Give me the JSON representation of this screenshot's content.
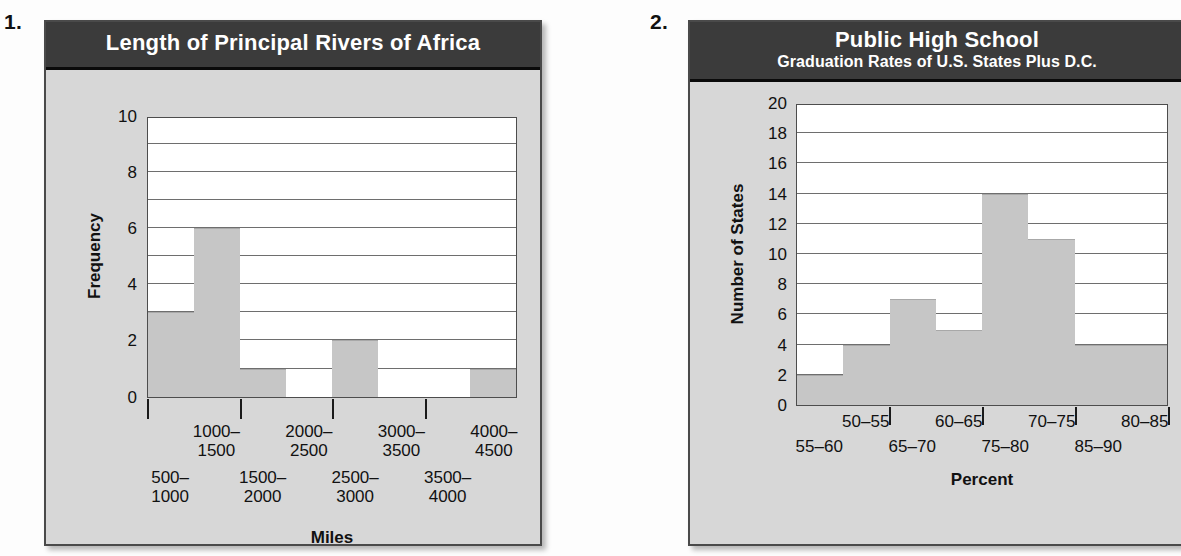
{
  "page": {
    "background_color": "#fdfdfd",
    "panel_color": "#d7d7d7",
    "title_bar_color": "#3b3b3b",
    "bar_color": "#c6c6c6",
    "gridline_color": "#6e6e6e"
  },
  "problems": [
    {
      "number": "1."
    },
    {
      "number": "2."
    }
  ],
  "figures": [
    {
      "id": "figure-1",
      "title_main": "Length of Principal Rivers of Africa",
      "title_sub": "",
      "ylabel": "Frequency",
      "xlabel": "Miles",
      "yticks": [
        "0",
        "2",
        "4",
        "6",
        "8",
        "10"
      ],
      "xlabels_upper": [
        "1000–\n1500",
        "2000–\n2500",
        "3000–\n3500",
        "4000–\n4500"
      ],
      "xlabels_lower": [
        "500–\n1000",
        "1500–\n2000",
        "2500–\n3000",
        "3500–\n4000"
      ],
      "xlabels_upper_l1": [
        "1000–",
        "2000–",
        "3000–",
        "4000–"
      ],
      "xlabels_upper_l2": [
        "1500",
        "2500",
        "3500",
        "4500"
      ],
      "xlabels_lower_l1": [
        "500–",
        "1500–",
        "2500–",
        "3500–"
      ],
      "xlabels_lower_l2": [
        "1000",
        "2000",
        "3000",
        "4000"
      ]
    },
    {
      "id": "figure-2",
      "title_main": "Public High School",
      "title_sub": "Graduation Rates of U.S. States Plus D.C.",
      "ylabel": "Number of States",
      "xlabel": "Percent",
      "yticks": [
        "0",
        "2",
        "4",
        "6",
        "8",
        "10",
        "12",
        "14",
        "16",
        "18",
        "20"
      ],
      "xlabels_upper_l1": [
        "50–55",
        "60–65",
        "70–75",
        "80–85"
      ],
      "xlabels_upper_l2": [
        "",
        "",
        "",
        ""
      ],
      "xlabels_lower_l1": [
        "55–60",
        "65–70",
        "75–80",
        "85–90"
      ],
      "xlabels_lower_l2": [
        "",
        "",
        "",
        ""
      ]
    }
  ],
  "chart_data": [
    {
      "type": "bar",
      "title": "Length of Principal Rivers of Africa",
      "xlabel": "Miles",
      "ylabel": "Frequency",
      "categories": [
        "500–1000",
        "1000–1500",
        "1500–2000",
        "2000–2500",
        "2500–3000",
        "3000–3500",
        "3500–4000",
        "4000–4500"
      ],
      "values": [
        3,
        6,
        1,
        0,
        2,
        0,
        0,
        1
      ],
      "ylim": [
        0,
        10
      ],
      "ytick_step": 2,
      "gridline_step": 1,
      "grid": true,
      "legend": "none",
      "bar_gap": 0
    },
    {
      "type": "bar",
      "title": "Public High School Graduation Rates of U.S. States Plus D.C.",
      "xlabel": "Percent",
      "ylabel": "Number of States",
      "categories": [
        "50–55",
        "55–60",
        "60–65",
        "65–70",
        "70–75",
        "75–80",
        "80–85",
        "85–90"
      ],
      "values": [
        2,
        4,
        7,
        5,
        14,
        11,
        4,
        4
      ],
      "ylim": [
        0,
        20
      ],
      "ytick_step": 2,
      "gridline_step": 2,
      "grid": true,
      "legend": "none",
      "bar_gap": 0
    }
  ]
}
